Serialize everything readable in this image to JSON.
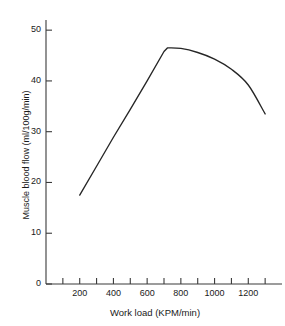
{
  "chart_data": {
    "type": "line",
    "title": "",
    "xlabel": "Work load (KPM/min)",
    "ylabel": "Muscle blood flow (ml/100g/min)",
    "xlim": [
      0,
      1400
    ],
    "ylim": [
      0,
      52
    ],
    "grid": false,
    "legend": "none",
    "x_major_ticks": [
      200,
      400,
      600,
      800,
      1000,
      1200
    ],
    "x_minor_ticks": [
      100,
      300,
      500,
      700,
      900,
      1100,
      1300
    ],
    "x_tick_labels": [
      "200",
      "400",
      "600",
      "800",
      "1000",
      "1200"
    ],
    "y_ticks": [
      0,
      10,
      20,
      30,
      40,
      50
    ],
    "y_tick_labels": [
      "0",
      "10",
      "20",
      "30",
      "40",
      "50"
    ],
    "series": [
      {
        "name": "Muscle blood flow",
        "color": "#262626",
        "x": [
          200,
          300,
          400,
          500,
          600,
          700,
          720,
          800,
          900,
          1000,
          1100,
          1200,
          1300
        ],
        "y": [
          17.5,
          23.2,
          28.9,
          34.4,
          40.0,
          45.8,
          46.5,
          46.4,
          45.6,
          44.3,
          42.3,
          39.2,
          33.5
        ]
      }
    ]
  },
  "axes": {
    "y_axis_title": "Muscle blood flow (ml/100g/min)",
    "x_axis_title": "Work load (KPM/min)"
  }
}
